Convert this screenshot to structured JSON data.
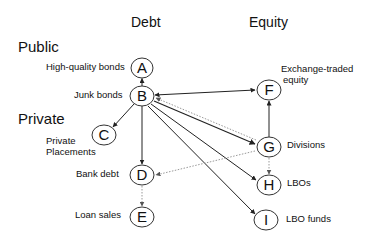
{
  "headers": {
    "debt": "Debt",
    "equity": "Equity"
  },
  "sides": {
    "public": "Public",
    "private": "Private"
  },
  "nodes": [
    {
      "id": "A",
      "letter": "A",
      "label": "High-quality bonds",
      "x": 142,
      "y": 68
    },
    {
      "id": "B",
      "letter": "B",
      "label": "Junk bonds",
      "x": 142,
      "y": 96
    },
    {
      "id": "C",
      "letter": "C",
      "label": "Private Placements",
      "x": 104,
      "y": 135
    },
    {
      "id": "D",
      "letter": "D",
      "label": "Bank debt",
      "x": 142,
      "y": 175
    },
    {
      "id": "E",
      "letter": "E",
      "label": "Loan sales",
      "x": 142,
      "y": 217
    },
    {
      "id": "F",
      "letter": "F",
      "label": "Exchange-traded equity",
      "x": 269,
      "y": 90
    },
    {
      "id": "G",
      "letter": "G",
      "label": "Divisions",
      "x": 269,
      "y": 147
    },
    {
      "id": "H",
      "letter": "H",
      "label": "LBOs",
      "x": 269,
      "y": 185
    },
    {
      "id": "I",
      "letter": "I",
      "label": "LBO funds",
      "x": 266,
      "y": 220
    }
  ],
  "edges": [
    {
      "from": "B",
      "to": "A",
      "style": "solid"
    },
    {
      "from": "B",
      "to": "C",
      "style": "solid"
    },
    {
      "from": "B",
      "to": "D",
      "style": "solid"
    },
    {
      "from": "B",
      "to": "F",
      "style": "solid"
    },
    {
      "from": "B",
      "to": "G",
      "style": "solid"
    },
    {
      "from": "G",
      "to": "B",
      "style": "dotted"
    },
    {
      "from": "B",
      "to": "H",
      "style": "solid"
    },
    {
      "from": "B",
      "to": "I",
      "style": "solid"
    },
    {
      "from": "G",
      "to": "F",
      "style": "solid"
    },
    {
      "from": "G",
      "to": "D",
      "style": "dotted"
    },
    {
      "from": "D",
      "to": "E",
      "style": "dotted"
    },
    {
      "from": "G",
      "to": "H",
      "style": "dotted"
    }
  ],
  "labels": {
    "A": "High-quality bonds",
    "B": "Junk bonds",
    "C1": "Private",
    "C2": "Placements",
    "D": "Bank debt",
    "E": "Loan sales",
    "F1": "Exchange-traded",
    "F2": "equity",
    "G": "Divisions",
    "H": "LBOs",
    "I": "LBO funds"
  },
  "letters": {
    "A": "A",
    "B": "B",
    "C": "C",
    "D": "D",
    "E": "E",
    "F": "F",
    "G": "G",
    "H": "H",
    "I": "I"
  },
  "colors": {
    "line": "#222222",
    "dotted": "#999999",
    "text": "#111111"
  }
}
